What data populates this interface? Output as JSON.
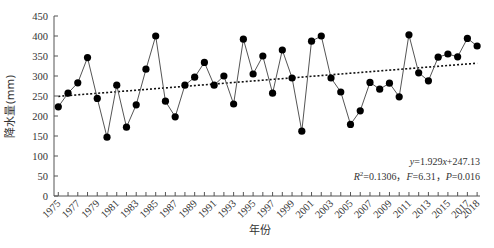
{
  "chart_data": {
    "type": "line",
    "title": "",
    "xlabel": "年份",
    "ylabel": "降水量(mm)",
    "ylim": [
      0,
      450
    ],
    "yticks": [
      0,
      50,
      100,
      150,
      200,
      250,
      300,
      350,
      400,
      450
    ],
    "xticks_labels": [
      "1975",
      "1977",
      "1979",
      "1981",
      "1983",
      "1985",
      "1987",
      "1989",
      "1991",
      "1993",
      "1995",
      "1997",
      "1999",
      "2001",
      "2003",
      "2005",
      "2007",
      "2009",
      "2011",
      "2013",
      "2015",
      "2017",
      "2018"
    ],
    "grid": false,
    "legend": null,
    "x": [
      1975,
      1976,
      1977,
      1978,
      1979,
      1980,
      1981,
      1982,
      1983,
      1984,
      1985,
      1986,
      1987,
      1988,
      1989,
      1990,
      1991,
      1992,
      1993,
      1994,
      1995,
      1996,
      1997,
      1998,
      1999,
      2000,
      2001,
      2002,
      2003,
      2004,
      2005,
      2006,
      2007,
      2008,
      2009,
      2010,
      2011,
      2012,
      2013,
      2014,
      2015,
      2016,
      2017,
      2018
    ],
    "series": [
      {
        "name": "降水量",
        "style": "solid line with filled circle markers",
        "values": [
          223,
          257,
          283,
          346,
          244,
          147,
          277,
          172,
          228,
          317,
          400,
          237,
          198,
          277,
          297,
          334,
          277,
          300,
          230,
          392,
          305,
          350,
          257,
          365,
          295,
          162,
          387,
          400,
          295,
          260,
          179,
          213,
          284,
          267,
          282,
          248,
          403,
          308,
          288,
          347,
          355,
          348,
          394,
          375
        ]
      },
      {
        "name": "linear trend",
        "style": "dotted line",
        "slope": 1.929,
        "intercept": 247.13
      }
    ],
    "annotations": {
      "equation": "y=1.929x+247.13",
      "stats": "R²=0.1306，F=6.31，P=0.016"
    }
  },
  "annotation": {
    "line1_y": "y",
    "line1_rest": "=1.929",
    "line1_x": "x",
    "line1_tail": "+247.13",
    "line2_R": "R",
    "line2_sup": "2",
    "line2_a": "=0.1306，",
    "line2_F": "F",
    "line2_b": "=6.31，",
    "line2_P": "P",
    "line2_c": "=0.016"
  },
  "colors": {
    "line": "#555555",
    "marker": "#000000",
    "trend": "#111111",
    "axis": "#555555"
  }
}
